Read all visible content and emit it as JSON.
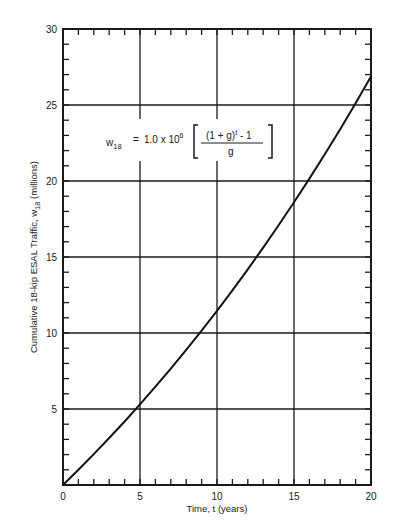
{
  "chart_data": {
    "type": "line",
    "title": "",
    "xlabel": "Time, t (years)",
    "ylabel": "Cumulative 18-kip ESAL Traffic,  w18  (millions)",
    "xlim": [
      0,
      20
    ],
    "ylim": [
      0,
      30
    ],
    "x_ticks": [
      0,
      5,
      10,
      15,
      20
    ],
    "y_ticks": [
      5,
      10,
      15,
      20,
      25,
      30
    ],
    "x_tick_labels": [
      "0",
      "5",
      "10",
      "15",
      "20"
    ],
    "y_tick_labels": [
      "5",
      "10",
      "15",
      "20",
      "25",
      "30"
    ],
    "grid": true,
    "minor_tick_step_x": 1,
    "minor_tick_step_y": 1,
    "legend": null,
    "annotation": {
      "lhs": "w",
      "lhs_sub": "18",
      "eq": "=",
      "coef": "1.0 x 10",
      "coef_exp": "6",
      "numerator": "(1  +  g)",
      "numerator_exp": "t",
      "numerator_tail": " - 1",
      "denominator": "g"
    },
    "series": [
      {
        "name": "w18",
        "x": [
          0,
          1,
          2,
          3,
          4,
          5,
          6,
          7,
          8,
          9,
          10,
          11,
          12,
          13,
          14,
          15,
          16,
          17,
          18,
          19,
          20
        ],
        "values": [
          0,
          1.0,
          2.03,
          3.09,
          4.18,
          5.31,
          6.47,
          7.66,
          8.89,
          10.16,
          11.46,
          12.81,
          14.19,
          15.62,
          17.09,
          18.6,
          20.16,
          21.76,
          23.41,
          25.12,
          26.87
        ]
      }
    ]
  }
}
